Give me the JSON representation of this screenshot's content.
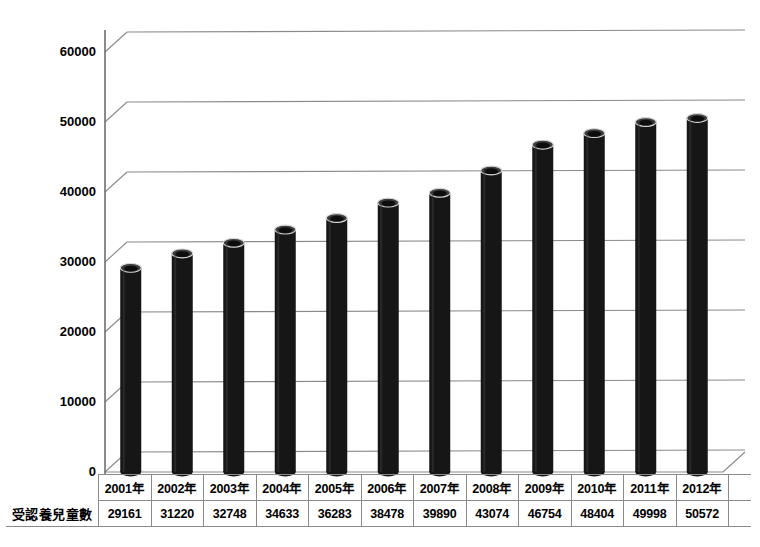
{
  "chart_data": {
    "type": "bar",
    "title": "",
    "subtitle": "",
    "xlabel": "",
    "ylabel": "",
    "ylim": [
      0,
      60000
    ],
    "grid": true,
    "legend": "none",
    "style": "3d-cylinder",
    "categories": [
      "2001年",
      "2002年",
      "2003年",
      "2004年",
      "2005年",
      "2006年",
      "2007年",
      "2008年",
      "2009年",
      "2010年",
      "2011年",
      "2012年"
    ],
    "series": [
      {
        "name": "受認養兒童數",
        "values": [
          29161,
          31220,
          32748,
          34633,
          36283,
          38478,
          39890,
          43074,
          46754,
          48404,
          49998,
          50572
        ]
      }
    ],
    "ytick_labels": [
      "0",
      "10000",
      "20000",
      "30000",
      "40000",
      "50000",
      "60000"
    ],
    "ytick_values": [
      0,
      10000,
      20000,
      30000,
      40000,
      50000,
      60000
    ],
    "bar_color": "#161616",
    "gridline_color": "#8a8a8a",
    "axis_color": "#6e6e6e",
    "background": "#ffffff",
    "text_color": "#000000"
  },
  "table": {
    "row_label": "受認養兒童數",
    "header": [
      "2001年",
      "2002年",
      "2003年",
      "2004年",
      "2005年",
      "2006年",
      "2007年",
      "2008年",
      "2009年",
      "2010年",
      "2011年",
      "2012年"
    ],
    "values": [
      "29161",
      "31220",
      "32748",
      "34633",
      "36283",
      "38478",
      "39890",
      "43074",
      "46754",
      "48404",
      "49998",
      "50572"
    ]
  }
}
